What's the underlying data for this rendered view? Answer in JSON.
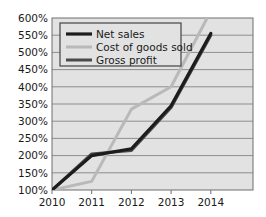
{
  "chart_data": {
    "type": "line",
    "title": "",
    "subtitle": "",
    "xlabel": "",
    "ylabel": "",
    "categories": [
      "2010",
      "2011",
      "2012",
      "2013",
      "2014"
    ],
    "x": [
      2010,
      2011,
      2012,
      2013,
      2014
    ],
    "ylim": [
      100,
      600
    ],
    "ytick_step": 50,
    "ytick_labels": [
      "100%",
      "150%",
      "200%",
      "250%",
      "300%",
      "350%",
      "400%",
      "450%",
      "500%",
      "550%",
      "600%"
    ],
    "ytick_values": [
      100,
      150,
      200,
      250,
      300,
      350,
      400,
      450,
      500,
      550,
      600
    ],
    "xtick_labels": [
      "2010",
      "2011",
      "2012",
      "2013",
      "2014"
    ],
    "grid": true,
    "grid_axis": "y",
    "legend_position": "top-left-inside",
    "series": [
      {
        "name": "Net sales",
        "values": [
          100,
          200,
          220,
          345,
          555
        ],
        "color": "#1c1c1c",
        "width": 3.2
      },
      {
        "name": "Cost of goods sold",
        "values": [
          100,
          125,
          335,
          400,
          620
        ],
        "color": "#b9b9b9",
        "width": 3.0,
        "clipped_at_top": true
      },
      {
        "name": "Gross profit",
        "values": [
          100,
          205,
          215,
          340,
          550
        ],
        "color": "#4a4a4a",
        "width": 3.0
      }
    ],
    "colors": {
      "plot_background": "#e2e2e2",
      "page_background": "#ffffff",
      "gridline": "#8e8e8e",
      "axis_frame": "#6e6e6e",
      "text": "#1a1a1a",
      "legend_background": "#e2e2e2",
      "legend_border": "#444444"
    }
  },
  "legend": {
    "items": [
      {
        "label": "Net sales"
      },
      {
        "label": "Cost of goods sold"
      },
      {
        "label": "Gross profit"
      }
    ]
  },
  "axes": {
    "y": {
      "labels": [
        "600%",
        "550%",
        "500%",
        "450%",
        "400%",
        "350%",
        "300%",
        "250%",
        "200%",
        "150%",
        "100%"
      ]
    },
    "x": {
      "labels": [
        "2010",
        "2011",
        "2012",
        "2013",
        "2014"
      ]
    }
  }
}
